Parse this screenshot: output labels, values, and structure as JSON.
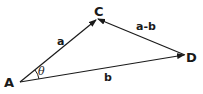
{
  "diagram": {
    "type": "vector-triangle",
    "points": {
      "A": {
        "label": "A",
        "x": 20,
        "y": 82
      },
      "C": {
        "label": "C",
        "x": 97,
        "y": 19
      },
      "D": {
        "label": "D",
        "x": 185,
        "y": 55
      }
    },
    "vectors": [
      {
        "from": "A",
        "to": "C",
        "label": "a"
      },
      {
        "from": "A",
        "to": "D",
        "label": "b"
      },
      {
        "from": "D",
        "to": "C",
        "label": "a-b"
      }
    ],
    "angle": {
      "at": "A",
      "label": "θ"
    },
    "colors": {
      "stroke": "#1a1a1a",
      "background": "#ffffff"
    }
  }
}
